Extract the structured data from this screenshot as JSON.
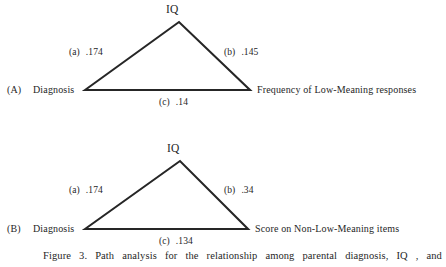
{
  "figure": {
    "background_color": "#ffffff",
    "ink_color": "#262626",
    "caption": "Figure 3. Path analysis for the relationship among parental diagnosis, IQ , and",
    "caption_words": [
      "Figure",
      "3.",
      "Path",
      "analysis",
      "for",
      "the",
      "relationship",
      "among",
      "parental",
      "diagnosis,",
      "IQ",
      ",",
      "and"
    ]
  },
  "panels": [
    {
      "id": "A",
      "panel_label": "(A)",
      "apex_label": "IQ",
      "left_node_label": "Diagnosis",
      "right_node_label": "Frequency of Low-Meaning responses",
      "paths": [
        {
          "key": "(a)",
          "value": ".174",
          "position": "left"
        },
        {
          "key": "(b)",
          "value": ".145",
          "position": "right"
        },
        {
          "key": "(c)",
          "value": ".14",
          "position": "base"
        }
      ]
    },
    {
      "id": "B",
      "panel_label": "(B)",
      "apex_label": "IQ",
      "left_node_label": "Diagnosis",
      "right_node_label": "Score on Non-Low-Meaning items",
      "paths": [
        {
          "key": "(a)",
          "value": ".174",
          "position": "left"
        },
        {
          "key": "(b)",
          "value": ".34",
          "position": "right"
        },
        {
          "key": "(c)",
          "value": ".134",
          "position": "base"
        }
      ]
    }
  ],
  "chart_data": {
    "type": "diagram",
    "subplots": [
      {
        "label": "(A)",
        "nodes": [
          "Diagnosis",
          "IQ",
          "Frequency of Low-Meaning responses"
        ],
        "edges": [
          {
            "id": "(a)",
            "from": "Diagnosis",
            "to": "IQ",
            "coefficient": 0.174,
            "display": ".174"
          },
          {
            "id": "(b)",
            "from": "IQ",
            "to": "Frequency of Low-Meaning responses",
            "coefficient": 0.145,
            "display": ".145"
          },
          {
            "id": "(c)",
            "from": "Diagnosis",
            "to": "Frequency of Low-Meaning responses",
            "coefficient": 0.14,
            "display": ".14"
          }
        ]
      },
      {
        "label": "(B)",
        "nodes": [
          "Diagnosis",
          "IQ",
          "Score on Non-Low-Meaning items"
        ],
        "edges": [
          {
            "id": "(a)",
            "from": "Diagnosis",
            "to": "IQ",
            "coefficient": 0.174,
            "display": ".174"
          },
          {
            "id": "(b)",
            "from": "IQ",
            "to": "Score on Non-Low-Meaning items",
            "coefficient": 0.34,
            "display": ".34"
          },
          {
            "id": "(c)",
            "from": "Diagnosis",
            "to": "Score on Non-Low-Meaning items",
            "coefficient": 0.134,
            "display": ".134"
          }
        ]
      }
    ]
  }
}
